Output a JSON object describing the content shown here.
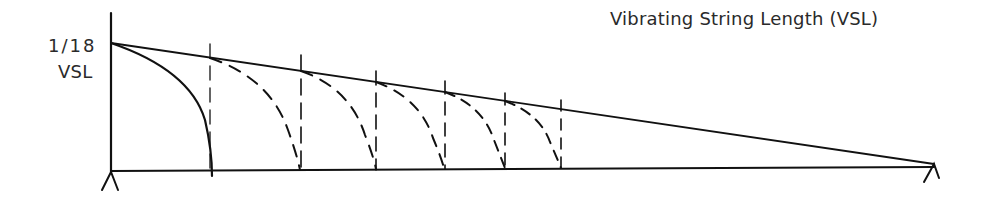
{
  "title": "Vibrating String Length (VSL)",
  "y_label": {
    "line1": "1/18",
    "line2": "VSL"
  },
  "geometry": {
    "nut": {
      "x": 111,
      "y_top": 43,
      "y_base": 171
    },
    "bridge": {
      "x": 934,
      "y": 164
    },
    "fret_positions_x": [
      210,
      301,
      376,
      445,
      505,
      561
    ],
    "arc_style": {
      "first": "solid",
      "others": "dashed"
    }
  },
  "colors": {
    "ink": "#111111",
    "text": "#2a2a2a",
    "background": "#ffffff"
  }
}
